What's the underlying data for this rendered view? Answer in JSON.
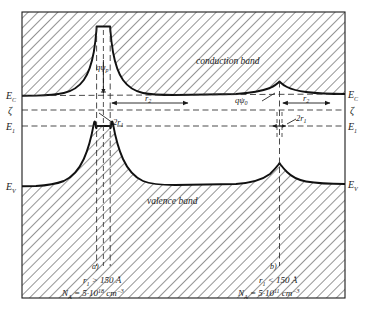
{
  "figure": {
    "type": "energy-band-diagram",
    "title": "",
    "bands": {
      "conduction_label": "conduction band",
      "valence_label": "valence band"
    },
    "axis_labels": {
      "Ec_left": "E",
      "Ec_left_sub": "C",
      "Ec_right": "E",
      "Ec_right_sub": "C",
      "zeta_left": "ζ",
      "zeta_right": "ζ",
      "E1_left": "E",
      "E1_left_sub": "1",
      "E1_right": "E",
      "E1_right_sub": "1",
      "Ev_left": "E",
      "Ev_left_sub": "V",
      "Ev_right": "E",
      "Ev_right_sub": "V"
    },
    "annotations": {
      "q_psi_p": "qψ",
      "q_psi_p_sub": "p",
      "q_psi_0": "qψ",
      "q_psi_0_sub": "0",
      "r2_left": "r",
      "r2_left_sub": "2",
      "r2_right": "r",
      "r2_right_sub": "2",
      "two_r1_left": "2r",
      "two_r1_left_sub": "1",
      "two_r1_right": "2r",
      "two_r1_right_sub": "1"
    },
    "panels": [
      {
        "key": "a",
        "tag": "a)",
        "condition_symbol": "r",
        "condition_sub": "1",
        "condition_rel": " > 150 Å",
        "density_symbol": "N",
        "density_sub": "A",
        "density_value": " = 5·10",
        "density_exp": "18",
        "density_unit": " cm",
        "density_unit_exp": "−3"
      },
      {
        "key": "b",
        "tag": "b)",
        "condition_symbol": "r",
        "condition_sub": "1",
        "condition_rel": " < 150 Å",
        "density_symbol": "N",
        "density_sub": "A",
        "density_value": " = 5·10",
        "density_exp": "11",
        "density_unit": " cm",
        "density_unit_exp": "−3"
      }
    ],
    "colors": {
      "ink": "#1a1a1a",
      "hatch": "#2b2b2b",
      "dashed": "#3a3a3a",
      "background": "#ffffff"
    }
  }
}
